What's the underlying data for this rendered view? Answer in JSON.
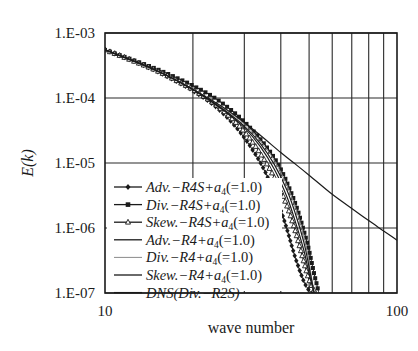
{
  "chart_data": {
    "type": "line",
    "title": "",
    "xlabel": "wave number",
    "ylabel": "E(k)",
    "xscale": "log",
    "yscale": "log",
    "xlim": [
      10,
      100
    ],
    "ylim": [
      1e-07,
      0.001
    ],
    "x_tick_labels": [
      "10",
      "100"
    ],
    "x_minor_gridlines": [
      20,
      30,
      40,
      50,
      60,
      70,
      80,
      90
    ],
    "y_tick_labels": [
      "1.E-03",
      "1.E-04",
      "1.E-05",
      "1.E-06",
      "1.E-07"
    ],
    "y_tick_values": [
      0.001,
      0.0001,
      1e-05,
      1e-06,
      1e-07
    ],
    "grid": true,
    "legend_position": "lower left (inside)",
    "series": [
      {
        "name": "Adv.-R4S+a4(=1.0)",
        "marker": "diamond",
        "style": "solid",
        "x": [
          10,
          12,
          15,
          18,
          20,
          23,
          26,
          29,
          32,
          35,
          38,
          40,
          42,
          44,
          46,
          48,
          50,
          52
        ],
        "y": [
          0.00055,
          0.0004,
          0.00026,
          0.00017,
          0.00013,
          8.5e-05,
          5.2e-05,
          3e-05,
          1.6e-05,
          8e-06,
          3.5e-06,
          1.9e-06,
          9.5e-07,
          4.6e-07,
          2.5e-07,
          1.5e-07,
          1.1e-07,
          1e-07
        ]
      },
      {
        "name": "Div.-R4S+a4(=1.0)",
        "marker": "square",
        "style": "solid",
        "x": [
          10,
          12,
          15,
          18,
          20,
          23,
          26,
          29,
          32,
          35,
          38,
          40,
          42,
          45,
          48,
          50,
          52,
          54
        ],
        "y": [
          0.00055,
          0.00041,
          0.00028,
          0.000195,
          0.000155,
          0.00011,
          7.5e-05,
          5e-05,
          3.2e-05,
          2e-05,
          1.2e-05,
          8e-06,
          5e-06,
          2.3e-06,
          9e-07,
          4.5e-07,
          2e-07,
          1e-07
        ]
      },
      {
        "name": "Skew.-R4S+a4(=1.0)",
        "marker": "triangle",
        "style": "solid",
        "x": [
          10,
          12,
          15,
          18,
          20,
          23,
          26,
          29,
          32,
          35,
          38,
          41,
          44,
          46,
          48,
          50,
          52,
          53
        ],
        "y": [
          0.00055,
          0.0004,
          0.000265,
          0.000175,
          0.000135,
          9e-05,
          5.8e-05,
          3.6e-05,
          2.1e-05,
          1.15e-05,
          6e-06,
          2.9e-06,
          1.2e-06,
          6e-07,
          3e-07,
          1.6e-07,
          1.1e-07,
          1e-07
        ]
      },
      {
        "name": "Adv.-R4+a4(=1.0)",
        "marker": "none",
        "style": "solid",
        "x": [
          10,
          15,
          20,
          26,
          30,
          34,
          38,
          42,
          45,
          48,
          50,
          52
        ],
        "y": [
          0.00055,
          0.000265,
          0.000135,
          6e-05,
          3.5e-05,
          1.8e-05,
          8e-06,
          3e-06,
          1.2e-06,
          4.5e-07,
          2e-07,
          1e-07
        ]
      },
      {
        "name": "Div.-R4+a4(=1.0)",
        "marker": "none",
        "style": "thin",
        "x": [
          10,
          15,
          20,
          26,
          30,
          34,
          38,
          42,
          45,
          48,
          50,
          52
        ],
        "y": [
          0.00055,
          0.000265,
          0.000137,
          6.5e-05,
          4e-05,
          2.2e-05,
          1.1e-05,
          4.5e-06,
          2e-06,
          7.5e-07,
          3e-07,
          1e-07
        ]
      },
      {
        "name": "Skew.-R4+a4(=1.0)",
        "marker": "none",
        "style": "solid",
        "x": [
          10,
          15,
          20,
          26,
          30,
          34,
          38,
          42,
          45,
          48,
          50,
          52
        ],
        "y": [
          0.00055,
          0.000265,
          0.000136,
          6.2e-05,
          3.7e-05,
          2e-05,
          9.5e-06,
          3.8e-06,
          1.6e-06,
          6e-07,
          2.5e-07,
          1e-07
        ]
      },
      {
        "name": "DNS(Div.-R2S)",
        "marker": "none",
        "style": "solid",
        "x": [
          10,
          15,
          20,
          25,
          30,
          35,
          40,
          45,
          50,
          60,
          70,
          80,
          90,
          100
        ],
        "y": [
          0.00055,
          0.000265,
          0.000135,
          7.5e-05,
          4.2e-05,
          2.4e-05,
          1.45e-05,
          9.5e-06,
          6.5e-06,
          3.3e-06,
          2e-06,
          1.3e-06,
          9e-07,
          6.5e-07
        ]
      }
    ]
  },
  "legend": {
    "entries": [
      {
        "pre": "Adv.",
        "mid": "−R4S+",
        "a": "a",
        "sub": "4",
        "post": "(=1.0)",
        "marker": "diamond"
      },
      {
        "pre": "Div.",
        "mid": "−R4S+",
        "a": "a",
        "sub": "4",
        "post": "(=1.0)",
        "marker": "square"
      },
      {
        "pre": "Skew.",
        "mid": "−R4S+",
        "a": "a",
        "sub": "4",
        "post": "(=1.0)",
        "marker": "triangle"
      },
      {
        "pre": "Adv.",
        "mid": "−R4+",
        "a": "a",
        "sub": "4",
        "post": "(=1.0)",
        "marker": "none"
      },
      {
        "pre": "Div.",
        "mid": "−R4+",
        "a": "a",
        "sub": "4",
        "post": "(=1.0)",
        "marker": "thin"
      },
      {
        "pre": "Skew.",
        "mid": "−R4+",
        "a": "a",
        "sub": "4",
        "post": "(=1.0)",
        "marker": "none"
      },
      {
        "pre": "DNS",
        "mid": "(Div.−R2S)",
        "a": "",
        "sub": "",
        "post": "",
        "marker": "none"
      }
    ]
  },
  "colors": {
    "ink": "#1a1a1a",
    "grid": "#2a2a2a",
    "thin": "#8a8a8a",
    "background": "#ffffff"
  }
}
